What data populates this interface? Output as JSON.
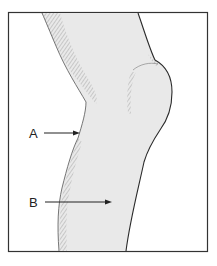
{
  "figure": {
    "labels": [
      {
        "id": "A",
        "text": "A",
        "x": 29,
        "y": 127,
        "arrow": {
          "x1": 44,
          "y1": 133,
          "x2": 80,
          "y2": 133
        }
      },
      {
        "id": "B",
        "text": "B",
        "x": 29,
        "y": 196,
        "arrow": {
          "x1": 45,
          "y1": 202,
          "x2": 112,
          "y2": 202
        }
      }
    ],
    "colors": {
      "frame": "#333333",
      "fill": "#e9e9e9",
      "outline": "#2a2a2a",
      "hatch": "#8a8a8a"
    }
  }
}
